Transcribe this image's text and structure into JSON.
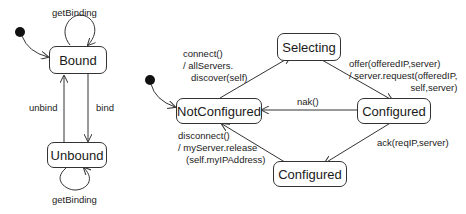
{
  "diagram": {
    "left": {
      "states": {
        "bound": "Bound",
        "unbound": "Unbound"
      },
      "transitions": {
        "bound_self": "getBinding",
        "unbound_self": "getBinding",
        "unbind": "unbind",
        "bind": "bind"
      }
    },
    "right": {
      "states": {
        "not_configured": "NotConfigured",
        "selecting": "Selecting",
        "configured_mid": "Configured",
        "configured_bottom": "Configured"
      },
      "transitions": {
        "connect": [
          "connect()",
          "/ allServers.",
          "discover(self)"
        ],
        "offer": [
          "offer(offeredIP,server)",
          "/ server.request(offeredIP,",
          "self,server)"
        ],
        "nak": "nak()",
        "ack": "ack(reqIP,server)",
        "disconnect": [
          "disconnect()",
          "/ myServer.release",
          "(self.myIPAddress)"
        ]
      }
    }
  }
}
